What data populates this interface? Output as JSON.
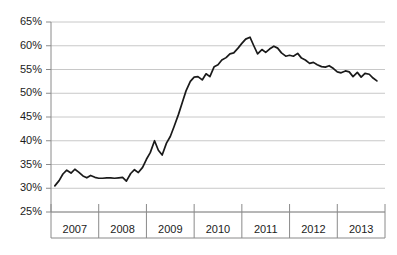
{
  "chart_data": {
    "type": "line",
    "title": "",
    "subtitle": "",
    "xlabel": "",
    "ylabel": "",
    "ylim": [
      25,
      65
    ],
    "xlim": [
      2006.5,
      2013.5
    ],
    "grid": true,
    "legend": false,
    "legend_position": "none",
    "y_ticks": [
      "25%",
      "30%",
      "35%",
      "40%",
      "45%",
      "50%",
      "55%",
      "60%",
      "65%"
    ],
    "y_tick_values": [
      25,
      30,
      35,
      40,
      45,
      50,
      55,
      60,
      65
    ],
    "x_ticks": [
      "2007",
      "2008",
      "2009",
      "2010",
      "2011",
      "2012",
      "2013"
    ],
    "x_tick_values": [
      2007,
      2008,
      2009,
      2010,
      2011,
      2012,
      2013
    ],
    "line_color": "#1a1a1a",
    "grid_color": "#c8c8c8",
    "axis_color": "#8a8a8a",
    "background_color": "#ffffff",
    "series": [
      {
        "name": "Series 1",
        "x": [
          2006.58,
          2006.67,
          2006.75,
          2006.83,
          2006.92,
          2007.0,
          2007.08,
          2007.17,
          2007.25,
          2007.33,
          2007.42,
          2007.5,
          2007.58,
          2007.67,
          2007.75,
          2007.83,
          2007.92,
          2008.0,
          2008.08,
          2008.17,
          2008.25,
          2008.33,
          2008.42,
          2008.5,
          2008.58,
          2008.67,
          2008.75,
          2008.83,
          2008.92,
          2009.0,
          2009.08,
          2009.17,
          2009.25,
          2009.33,
          2009.42,
          2009.5,
          2009.58,
          2009.67,
          2009.75,
          2009.83,
          2009.92,
          2010.0,
          2010.08,
          2010.17,
          2010.25,
          2010.33,
          2010.42,
          2010.5,
          2010.58,
          2010.67,
          2010.75,
          2010.83,
          2010.92,
          2011.0,
          2011.08,
          2011.17,
          2011.25,
          2011.33,
          2011.42,
          2011.5,
          2011.58,
          2011.67,
          2011.75,
          2011.83,
          2011.92,
          2012.0,
          2012.08,
          2012.17,
          2012.25,
          2012.33,
          2012.42,
          2012.5,
          2012.58,
          2012.67,
          2012.75,
          2012.83,
          2012.92,
          2013.0,
          2013.08,
          2013.17,
          2013.25,
          2013.33
        ],
        "values": [
          30.5,
          31.6,
          33.0,
          33.8,
          33.2,
          34.0,
          33.4,
          32.6,
          32.2,
          32.7,
          32.3,
          32.1,
          32.1,
          32.2,
          32.2,
          32.1,
          32.2,
          32.3,
          31.5,
          33.1,
          33.9,
          33.3,
          34.4,
          36.1,
          37.5,
          40.0,
          38.0,
          37.0,
          39.5,
          40.9,
          43.0,
          45.5,
          48.0,
          50.5,
          52.5,
          53.4,
          53.5,
          52.8,
          54.1,
          53.5,
          55.6,
          56.0,
          57.0,
          57.5,
          58.3,
          58.5,
          59.5,
          60.5,
          61.4,
          61.8,
          60.0,
          58.3,
          59.2,
          58.6,
          59.3,
          59.9,
          59.5,
          58.5,
          57.8,
          58.0,
          57.8,
          58.4,
          57.4,
          57.0,
          56.3,
          56.5,
          56.0,
          55.6,
          55.5,
          55.8,
          55.2,
          54.5,
          54.3,
          54.7,
          54.5,
          53.5,
          54.4,
          53.4,
          54.2,
          54.0,
          53.2,
          52.6
        ]
      }
    ]
  }
}
